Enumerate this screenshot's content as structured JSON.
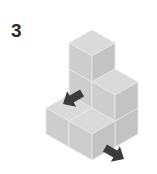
{
  "figure": {
    "label": "3",
    "colors": {
      "top": "#dadada",
      "left": "#cdcdcd",
      "right": "#c3c3c3",
      "edge": "#e9e9e9",
      "arrow": "#3b3b3b"
    },
    "projection": {
      "origin": [
        92,
        30
      ],
      "dx": 23,
      "dy": 13,
      "h": 26,
      "max_z": 3
    },
    "cubes": [
      {
        "x": 0,
        "y": 0,
        "z": 0
      },
      {
        "x": 0,
        "y": 0,
        "z": 1
      },
      {
        "x": 0,
        "y": 0,
        "z": 2
      },
      {
        "x": 1,
        "y": 0,
        "z": 0
      },
      {
        "x": 1,
        "y": 0,
        "z": 1
      },
      {
        "x": 0,
        "y": 1,
        "z": 0
      },
      {
        "x": 1,
        "y": 1,
        "z": 0
      }
    ],
    "arrows": [
      {
        "name": "view-arrow-left",
        "direction": "down-left",
        "tip": [
          63,
          104
        ],
        "angle": 150
      },
      {
        "name": "view-arrow-front",
        "direction": "down-right",
        "tip": [
          124,
          159
        ],
        "angle": 30
      }
    ]
  }
}
